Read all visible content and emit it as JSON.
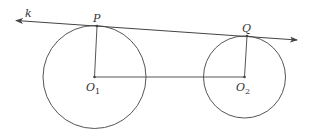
{
  "diagram": {
    "type": "two-circles-common-tangent",
    "stroke_color": "#555555",
    "labels": {
      "line": "k",
      "tangent_point_1": "P",
      "tangent_point_2": "Q",
      "center_1_letter": "O",
      "center_1_sub": "1",
      "center_2_letter": "O",
      "center_2_sub": "2"
    },
    "circles": [
      {
        "name": "O1",
        "cx": 94.5,
        "cy": 77,
        "r": 51.5
      },
      {
        "name": "O2",
        "cx": 244.5,
        "cy": 77,
        "r": 41
      }
    ],
    "points": {
      "P": {
        "x": 97,
        "y": 26
      },
      "Q": {
        "x": 247,
        "y": 36
      },
      "O1": {
        "x": 94.5,
        "y": 77
      },
      "O2": {
        "x": 244.5,
        "y": 77
      }
    },
    "line_k": {
      "x1": 16,
      "y1": 20,
      "x2": 297,
      "y2": 40,
      "arrows": "both"
    }
  }
}
